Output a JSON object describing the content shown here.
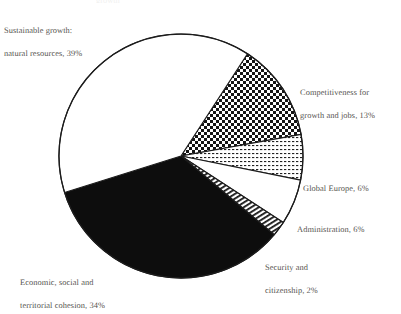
{
  "figure": {
    "kind": "pie-chart",
    "paper_color": "#ffffff",
    "ink_color": "#56544f",
    "outline_color": "#1c1c1c"
  },
  "title_ghost": "growth",
  "labels": {
    "sustainable": {
      "line1": "Sustainable growth:",
      "line2": "natural resources, 39%"
    },
    "competitiveness": {
      "line1": "Competitiveness for",
      "line2": "growth and jobs, 13%"
    },
    "global_europe": {
      "line1": "Global Europe, 6%"
    },
    "administration": {
      "line1": "Administration, 6%"
    },
    "security": {
      "line1": "Security and",
      "line2": "citizenship, 2%"
    },
    "economic": {
      "line1": "Economic, social and",
      "line2": "territorial cohesion, 34%"
    }
  },
  "chart_data": {
    "type": "pie",
    "title": "",
    "xlabel": "",
    "ylabel": "",
    "units": "percent",
    "total": 100,
    "legend_position": "callout-labels",
    "grid": false,
    "start_angle_deg": 33,
    "direction": "clockwise",
    "center": {
      "x": 181,
      "y": 156
    },
    "radius": 122,
    "categories": [
      "Competitiveness for growth and jobs",
      "Global Europe",
      "Administration",
      "Security and citizenship",
      "Economic, social and territorial cohesion",
      "Sustainable growth: natural resources"
    ],
    "values": [
      13,
      6,
      6,
      2,
      34,
      39
    ],
    "slices": [
      {
        "name": "Competitiveness for growth and jobs",
        "value": 13,
        "label": "Competitiveness for growth and jobs, 13%",
        "fill": "checkerboard",
        "start_deg": 33,
        "end_deg": 79.8
      },
      {
        "name": "Global Europe",
        "value": 6,
        "label": "Global Europe, 6%",
        "fill": "fine-dots",
        "start_deg": 79.8,
        "end_deg": 101.4
      },
      {
        "name": "Administration",
        "value": 6,
        "label": "Administration, 6%",
        "fill": "white",
        "start_deg": 101.4,
        "end_deg": 123.0
      },
      {
        "name": "Security and citizenship",
        "value": 2,
        "label": "Security and citizenship, 2%",
        "fill": "stripes",
        "start_deg": 123.0,
        "end_deg": 130.2
      },
      {
        "name": "Economic, social and territorial cohesion",
        "value": 34,
        "label": "Economic, social and territorial cohesion, 34%",
        "fill": "solid-black",
        "start_deg": 130.2,
        "end_deg": 252.6
      },
      {
        "name": "Sustainable growth: natural resources",
        "value": 39,
        "label": "Sustainable growth: natural resources, 39%",
        "fill": "white",
        "start_deg": 252.6,
        "end_deg": 393.0
      }
    ]
  }
}
